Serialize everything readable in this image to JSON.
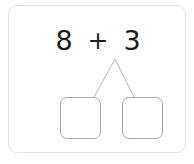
{
  "card": {
    "name": "number-bond-worksheet",
    "background_color": "#ffffff",
    "border_color": "#e3e3e5"
  },
  "equation": {
    "addend_1": "8",
    "operator": "+",
    "addend_2": "3",
    "full_text": "8 + 3",
    "text_color": "#1d1d1f"
  },
  "number_bond": {
    "line_color": "#b6b6bb",
    "apex": {
      "x": 106,
      "y": 53
    },
    "left_endpoint": {
      "x": 85,
      "y": 91
    },
    "right_endpoint": {
      "x": 125,
      "y": 91
    }
  },
  "answer_boxes": [
    {
      "label": "",
      "value": "",
      "placeholder": "",
      "position": "left"
    },
    {
      "label": "",
      "value": "",
      "placeholder": "",
      "position": "right"
    }
  ],
  "box_style": {
    "border_color": "#a9a9ae",
    "fill_color": "#ffffff"
  }
}
